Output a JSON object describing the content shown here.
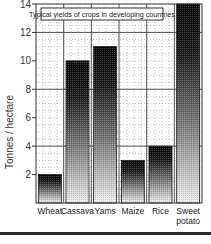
{
  "chart_data": {
    "type": "bar",
    "title": "Typical yields of crops in developing countries",
    "xlabel": "",
    "ylabel": "Tonnes / hectare",
    "categories": [
      "Wheat",
      "Cassava",
      "Yams",
      "Maize",
      "Rice",
      "Sweet potato"
    ],
    "category_lines": [
      [
        "Wheat"
      ],
      [
        "Cassava"
      ],
      [
        "Yams"
      ],
      [
        "Maize"
      ],
      [
        "Rice"
      ],
      [
        "Sweet",
        "potato"
      ]
    ],
    "values": [
      2,
      10,
      11,
      3,
      4,
      14
    ],
    "ylim": [
      0,
      14
    ],
    "yticks": [
      2,
      4,
      6,
      8,
      10,
      12,
      14
    ],
    "grid": true,
    "legend": null
  },
  "colors": {
    "bar_top": "#0a0a0a",
    "bar_bottom": "#f2f2f2",
    "axis": "#333333",
    "grid_major": "#444444",
    "grid_minor": "#9a9a9a"
  }
}
